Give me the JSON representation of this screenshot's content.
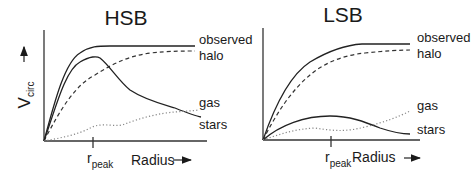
{
  "panels": [
    {
      "title": "HSB",
      "y_axis_label": "V",
      "y_axis_subscript": "circ",
      "x_axis_label": "Radius",
      "tick_label": "r",
      "tick_subscript": "peak",
      "curves": [
        {
          "name": "observed",
          "style": "solid"
        },
        {
          "name": "halo",
          "style": "dashed"
        },
        {
          "name": "gas",
          "style": "dotted"
        },
        {
          "name": "stars",
          "style": "solid"
        }
      ]
    },
    {
      "title": "LSB",
      "x_axis_label": "Radius",
      "tick_label": "r",
      "tick_subscript": "peak",
      "curves": [
        {
          "name": "observed",
          "style": "solid"
        },
        {
          "name": "halo",
          "style": "dashed"
        },
        {
          "name": "gas",
          "style": "dotted"
        },
        {
          "name": "stars",
          "style": "solid"
        }
      ]
    }
  ],
  "legend": {
    "hsb": {
      "observed": "observed",
      "halo": "halo",
      "gas": "gas",
      "stars": "stars"
    },
    "lsb": {
      "observed": "observed",
      "halo": "halo",
      "gas": "gas",
      "stars": "stars"
    }
  }
}
